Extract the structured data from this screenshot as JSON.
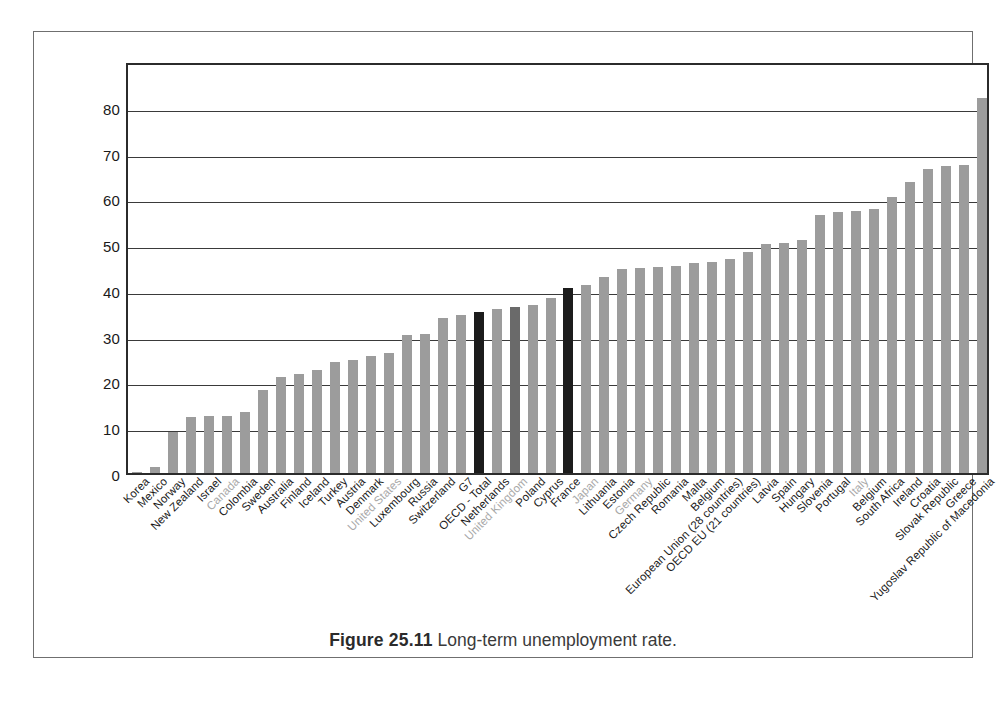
{
  "caption": {
    "figure_label": "Figure 25.11",
    "text": "Long-term unemployment rate."
  },
  "chart_data": {
    "type": "bar",
    "title": "Long-term unemployment rate",
    "xlabel": "",
    "ylabel": "",
    "ylim": [
      0,
      90
    ],
    "grid": true,
    "legend": "none",
    "y_ticks": [
      0,
      10,
      20,
      30,
      40,
      50,
      60,
      70,
      80
    ],
    "y_tick_labels": [
      "0",
      "10",
      "20",
      "30",
      "40",
      "50",
      "60",
      "70",
      "80"
    ],
    "categories": [
      "Korea",
      "Mexico",
      "Norway",
      "New Zealand",
      "Israel",
      "Canada",
      "Colombia",
      "Sweden",
      "Australia",
      "Finland",
      "Iceland",
      "Turkey",
      "Austria",
      "Denmark",
      "United States",
      "Luxembourg",
      "Russia",
      "Switzerland",
      "G7",
      "OECD - Total",
      "Netherlands",
      "United Kingdom",
      "Poland",
      "Cyprus",
      "France",
      "Japan",
      "Lithuania",
      "Estonia",
      "Germany",
      "Czech Republic",
      "Romania",
      "Malta",
      "Belgium",
      "European Union (28 countries)",
      "OECD EU (21 countries)",
      "Latvia",
      "Spain",
      "Hungary",
      "Slovenia",
      "Portugal",
      "Italy",
      "Belgium",
      "South Africa",
      "Ireland",
      "Croatia",
      "Slovak Republic",
      "Greece",
      "Yugoslav Republic of Macedonia"
    ],
    "values": [
      0.3,
      1.3,
      9.0,
      12.2,
      12.4,
      12.5,
      13.4,
      18.1,
      20.9,
      21.6,
      22.4,
      24.3,
      24.7,
      25.6,
      26.2,
      30.2,
      30.4,
      33.8,
      34.6,
      35.1,
      35.8,
      36.2,
      36.6,
      38.3,
      40.4,
      41.1,
      42.9,
      44.5,
      44.8,
      45.1,
      45.2,
      45.8,
      46.0,
      46.7,
      48.3,
      50.0,
      50.3,
      51.0,
      56.3,
      57.0,
      57.3,
      57.7,
      60.4,
      63.5,
      66.5,
      67.0,
      67.2,
      82.0
    ],
    "bar_colors": [
      "light",
      "light",
      "light",
      "light",
      "light",
      "dark",
      "light",
      "light",
      "light",
      "light",
      "light",
      "light",
      "light",
      "light",
      "light",
      "light",
      "light",
      "light",
      "light",
      "black",
      "light",
      "mid",
      "light",
      "light",
      "black",
      "light",
      "light",
      "light",
      "light",
      "light",
      "light",
      "light",
      "light",
      "light",
      "light",
      "light",
      "light",
      "light",
      "light",
      "light",
      "light",
      "light",
      "light",
      "light",
      "light",
      "light",
      "light",
      "light"
    ],
    "label_muted": [
      false,
      false,
      false,
      false,
      false,
      true,
      false,
      false,
      false,
      false,
      false,
      false,
      false,
      false,
      true,
      false,
      false,
      false,
      false,
      false,
      false,
      true,
      false,
      false,
      false,
      true,
      false,
      false,
      true,
      false,
      false,
      false,
      false,
      false,
      false,
      false,
      false,
      false,
      false,
      false,
      true,
      false,
      false,
      false,
      false,
      false,
      false,
      false
    ]
  },
  "colors": {
    "bar_light": "#9c9c9c",
    "bar_mid": "#6a6a6a",
    "bar_black": "#1c1c1c",
    "gridline": "#3a3a3a",
    "axis": "#2b2b2b",
    "frame": "#6f6f6f",
    "label_muted": "#a8a8a8",
    "label": "#1a1a1a"
  }
}
